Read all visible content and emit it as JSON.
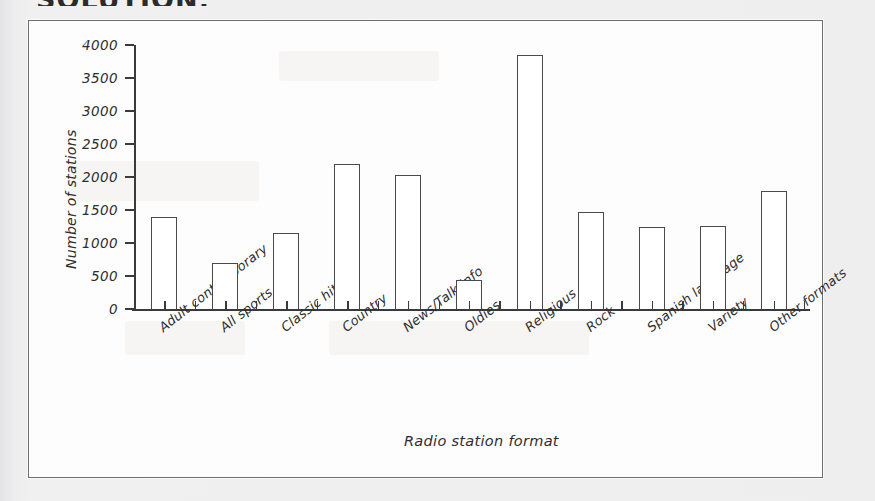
{
  "heading": "SOLUTION:",
  "chart_data": {
    "type": "bar",
    "title": "",
    "xlabel": "Radio station format",
    "ylabel": "Number of stations",
    "categories": [
      "Adult contemporary",
      "All sports",
      "Classic hits",
      "Country",
      "News/Talk/Info",
      "Oldies",
      "Religious",
      "Rock",
      "Spanish language",
      "Variety",
      "Other formats"
    ],
    "values": [
      1400,
      690,
      1150,
      2200,
      2030,
      440,
      3850,
      1470,
      1250,
      1260,
      1790
    ],
    "ylim": [
      0,
      4000
    ],
    "yticks": [
      0,
      500,
      1000,
      1500,
      2000,
      2500,
      3000,
      3500,
      4000
    ],
    "ytick_labels": [
      "0",
      "500",
      "1000",
      "1500",
      "2000",
      "2500",
      "3000",
      "3500",
      "4000"
    ],
    "grid": false,
    "legend": false,
    "bar_style": {
      "fill": "#ffffff",
      "edge": "#4a4a4c"
    },
    "axis_color": "#3a3a3c"
  }
}
